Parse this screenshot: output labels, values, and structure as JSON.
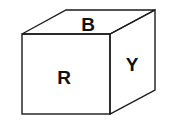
{
  "diagram": {
    "type": "cube-net-view",
    "faces": {
      "top": {
        "label": "B"
      },
      "front": {
        "label": "R"
      },
      "right": {
        "label": "Y"
      }
    },
    "colors": {
      "stroke": "#1a1a1a",
      "background": "#ffffff",
      "text": "#111111"
    }
  }
}
